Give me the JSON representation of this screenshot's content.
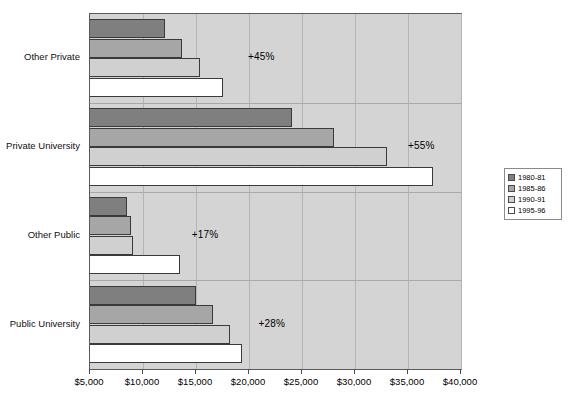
{
  "chart_data": {
    "type": "bar",
    "orientation": "horizontal",
    "title": "",
    "subtitle": "",
    "xlabel": "",
    "ylabel": "",
    "xlim": [
      5000,
      40000
    ],
    "xticks": [
      5000,
      10000,
      15000,
      20000,
      25000,
      30000,
      35000,
      40000
    ],
    "xtick_labels": [
      "$5,000",
      "$10,000",
      "$15,000",
      "$20,000",
      "$25,000",
      "$30,000",
      "$35,000",
      "$40,000"
    ],
    "grid": true,
    "grid_axis": "x",
    "legend_position": "right",
    "categories": [
      "Other Private",
      "Private University",
      "Other Public",
      "Public University"
    ],
    "series": [
      {
        "name": "1980-81",
        "color": "#7f7f7f",
        "values": [
          12050,
          24100,
          8500,
          15000
        ]
      },
      {
        "name": "1985-86",
        "color": "#a6a6a6",
        "values": [
          13700,
          28000,
          8850,
          16600
        ]
      },
      {
        "name": "1990-91",
        "color": "#d0d0d0",
        "values": [
          15400,
          33000,
          9100,
          18200
        ]
      },
      {
        "name": "1995-96",
        "color": "#ffffff",
        "values": [
          17500,
          37400,
          13500,
          19350
        ]
      }
    ],
    "annotations": [
      {
        "text": "+45%",
        "category": "Other Private",
        "x": 19900,
        "y_offset": 0
      },
      {
        "text": "+55%",
        "category": "Private University",
        "x": 35000,
        "y_offset": 0
      },
      {
        "text": "+17%",
        "category": "Other Public",
        "x": 14600,
        "y_offset": 0
      },
      {
        "text": "+28%",
        "category": "Public University",
        "x": 20900,
        "y_offset": 0
      }
    ]
  },
  "legend": {
    "items": [
      {
        "label": "1980-81"
      },
      {
        "label": "1985-86"
      },
      {
        "label": "1990-91"
      },
      {
        "label": "1995-96"
      }
    ]
  },
  "axis": {
    "x_labels": [
      "$5,000",
      "$10,000",
      "$15,000",
      "$20,000",
      "$25,000",
      "$30,000",
      "$35,000",
      "$40,000"
    ]
  },
  "categories": {
    "labels": [
      "Other Private",
      "Private University",
      "Other Public",
      "Public University"
    ]
  },
  "annotations": {
    "labels": [
      "+45%",
      "+55%",
      "+17%",
      "+28%"
    ]
  }
}
